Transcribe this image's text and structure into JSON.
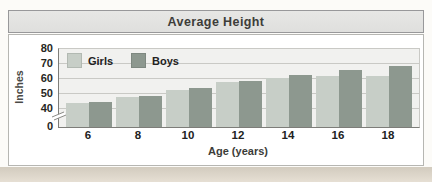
{
  "title": "Average Height",
  "chart_data": {
    "type": "bar",
    "title": "Average Height",
    "categories": [
      "6",
      "8",
      "10",
      "12",
      "14",
      "16",
      "18"
    ],
    "series": [
      {
        "name": "Girls",
        "color": "#c7cec7",
        "values": [
          44,
          48,
          53,
          58,
          61,
          62,
          62
        ]
      },
      {
        "name": "Boys",
        "color": "#8d988f",
        "values": [
          45,
          49,
          54,
          59,
          63,
          66,
          69
        ]
      }
    ],
    "xlabel": "Age (years)",
    "ylabel": "Inches",
    "y_ticks": [
      0,
      40,
      50,
      60,
      70,
      80
    ],
    "ylim": [
      0,
      80
    ],
    "axis_break_between": [
      0,
      40
    ],
    "grid": true,
    "legend_position": "top-left"
  },
  "colors": {
    "title_bar_bg": "#e7e7e5",
    "title_bar_border": "#98989a",
    "card_border": "#b6b6b2",
    "plot_bg": "#f1f1ef",
    "gridline": "#c9c9c5",
    "axis_line": "#7d7d79",
    "page_bottom_strip": "#d2cbbe"
  }
}
